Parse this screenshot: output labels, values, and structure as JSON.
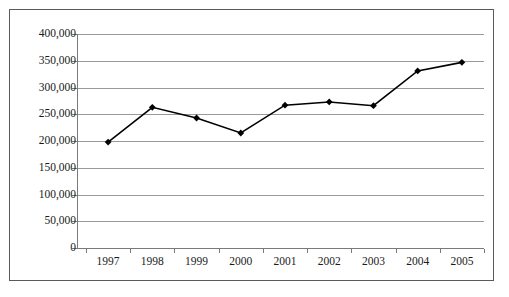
{
  "chart_data": {
    "type": "line",
    "title": "",
    "subtitle": "",
    "xlabel": "",
    "ylabel": "",
    "categories": [
      "1997",
      "1998",
      "1999",
      "2000",
      "2001",
      "2002",
      "2003",
      "2004",
      "2005"
    ],
    "series": [
      {
        "name": "",
        "values": [
          198000,
          263000,
          243000,
          215000,
          267000,
          273000,
          266000,
          331000,
          347000
        ]
      }
    ],
    "ylim": [
      0,
      400000
    ],
    "y_ticks": [
      0,
      50000,
      100000,
      150000,
      200000,
      250000,
      300000,
      350000,
      400000
    ],
    "y_tick_labels": [
      "0",
      "50,000",
      "100,000",
      "150,000",
      "200,000",
      "250,000",
      "300,000",
      "350,000",
      "400,000"
    ],
    "x_tick_labels": [
      "1997",
      "1998",
      "1999",
      "2000",
      "2001",
      "2002",
      "2003",
      "2004",
      "2005"
    ],
    "grid": true,
    "grid_axis": "y",
    "legend": false,
    "legend_position": "none",
    "marker": "diamond",
    "line_color": "#000000",
    "marker_color": "#000000",
    "grid_color": "#9a9a9a",
    "axis_color": "#7a7a7a",
    "border_color": "#5a5a5a",
    "background_color": "#ffffff"
  }
}
